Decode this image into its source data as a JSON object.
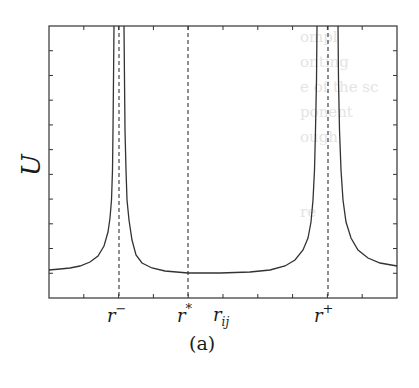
{
  "figure": {
    "caption": "(a)",
    "ylabel": "U",
    "xlabel_main": "r",
    "xlabel_sub": "ij"
  },
  "markers": [
    {
      "name": "r-minus",
      "base": "r",
      "sup": "−",
      "x_px": 119
    },
    {
      "name": "r-star",
      "base": "r",
      "sup": "*",
      "x_px": 188
    },
    {
      "name": "r-plus",
      "base": "r",
      "sup": "+",
      "x_px": 328
    }
  ],
  "background_text": [
    "",
    "ompl",
    "onting",
    "e of the sc",
    "ponent",
    "ough",
    "",
    "",
    "re",
    "",
    "",
    "",
    "",
    ""
  ],
  "chart_data": {
    "type": "line",
    "title": "",
    "xlabel": "r_ij",
    "ylabel": "U",
    "x_tick_labels": [
      "r−",
      "r*",
      "r+"
    ],
    "grid": false,
    "legend": null,
    "plot_box_px": {
      "left": 49,
      "top": 26,
      "right": 397,
      "bottom": 298
    },
    "y_ticks_count": 12,
    "x_ticks_count": 11,
    "vertical_dashed_lines_px": [
      119,
      188,
      328
    ],
    "curve_points_px": [
      [
        49,
        270
      ],
      [
        60,
        269
      ],
      [
        70,
        268
      ],
      [
        80,
        266
      ],
      [
        90,
        262
      ],
      [
        98,
        256
      ],
      [
        104,
        246
      ],
      [
        108,
        232
      ],
      [
        110,
        218
      ],
      [
        111.5,
        200
      ],
      [
        112.5,
        170
      ],
      [
        113,
        130
      ],
      [
        113.5,
        80
      ],
      [
        114,
        26
      ],
      [
        124,
        26
      ],
      [
        124.5,
        80
      ],
      [
        125,
        130
      ],
      [
        126,
        170
      ],
      [
        127,
        200
      ],
      [
        129,
        220
      ],
      [
        132,
        240
      ],
      [
        136,
        255
      ],
      [
        142,
        263
      ],
      [
        152,
        268
      ],
      [
        165,
        271
      ],
      [
        188,
        273
      ],
      [
        220,
        273
      ],
      [
        250,
        272
      ],
      [
        270,
        270
      ],
      [
        285,
        266
      ],
      [
        295,
        260
      ],
      [
        303,
        250
      ],
      [
        308,
        238
      ],
      [
        311,
        222
      ],
      [
        313,
        200
      ],
      [
        314.5,
        170
      ],
      [
        315.5,
        130
      ],
      [
        316.5,
        80
      ],
      [
        317,
        26
      ],
      [
        338,
        26
      ],
      [
        338.5,
        80
      ],
      [
        339.5,
        130
      ],
      [
        341,
        170
      ],
      [
        343,
        200
      ],
      [
        346,
        222
      ],
      [
        351,
        238
      ],
      [
        358,
        250
      ],
      [
        368,
        258
      ],
      [
        380,
        263
      ],
      [
        397,
        266
      ]
    ]
  }
}
